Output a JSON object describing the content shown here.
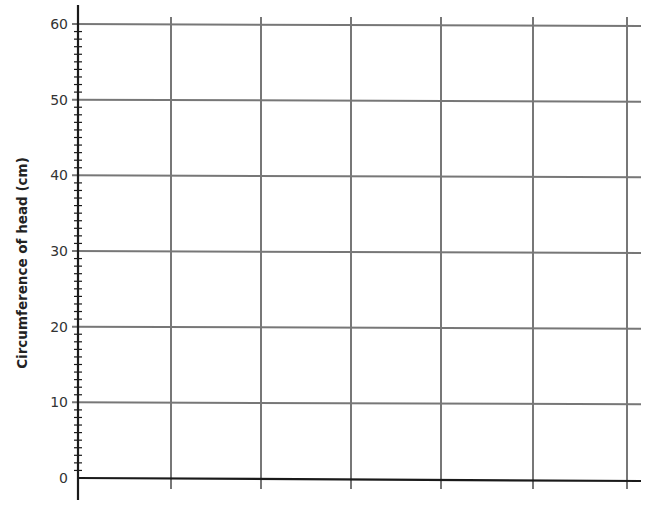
{
  "chart_data": {
    "type": "line",
    "title": "",
    "xlabel": "",
    "ylabel": "Circumference of head (cm)",
    "ylim": [
      0,
      60
    ],
    "y_ticks": [
      0,
      10,
      20,
      30,
      40,
      50,
      60
    ],
    "y_minor_tick_step": 1,
    "x_gridline_count": 6,
    "grid": true,
    "series": [],
    "note": "Blank grid for plotting; no data points drawn"
  },
  "colors": {
    "axis": "#1a1a1a",
    "grid": "#777777",
    "text": "#333333"
  }
}
